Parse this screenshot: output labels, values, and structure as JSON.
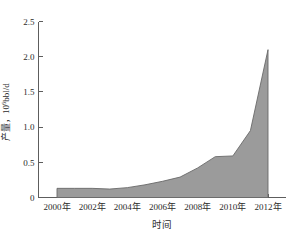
{
  "top_remnant": "⸺⸺  ⸺⸺⸺ ⸺⸺",
  "figure": {
    "y_axis_title_cn": "产量",
    "y_axis_title_sep": "，",
    "y_axis_title_unit_base": "10",
    "y_axis_title_unit_exp": "6",
    "y_axis_title_unit_tail": "bbl/d",
    "x_axis_title": "时间"
  },
  "chart_data": {
    "type": "area",
    "title": "",
    "xlabel": "时间",
    "ylabel": "产量，10⁶bbl/d",
    "x": [
      2000,
      2001,
      2002,
      2003,
      2004,
      2005,
      2006,
      2007,
      2008,
      2009,
      2010,
      2011,
      2012
    ],
    "values": [
      0.13,
      0.13,
      0.13,
      0.12,
      0.14,
      0.18,
      0.23,
      0.29,
      0.42,
      0.58,
      0.59,
      0.95,
      2.1
    ],
    "series": [
      {
        "name": "产量",
        "values": [
          0.13,
          0.13,
          0.13,
          0.12,
          0.14,
          0.18,
          0.23,
          0.29,
          0.42,
          0.58,
          0.59,
          0.95,
          2.1
        ]
      }
    ],
    "xlim": [
      2000,
      2012
    ],
    "ylim": [
      0,
      2.5
    ],
    "xticks": [
      2000,
      2002,
      2004,
      2006,
      2008,
      2010,
      2012
    ],
    "xtick_labels": [
      "2000年",
      "2002年",
      "2004年",
      "2006年",
      "2008年",
      "2010年",
      "2012年"
    ],
    "yticks": [
      0,
      0.5,
      1.0,
      1.5,
      2.0,
      2.5
    ],
    "ytick_labels": [
      "0",
      "0.5",
      "1.0",
      "1.5",
      "2.0",
      "2.5"
    ],
    "grid": false,
    "legend": false,
    "legend_position": "none",
    "fill_color": "#9b9b9b",
    "line_color": "#6a6a6a",
    "axis_color": "#5d5d5d",
    "background_color": "#ffffff"
  }
}
